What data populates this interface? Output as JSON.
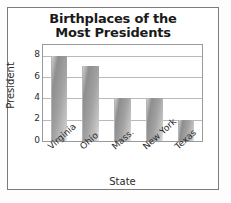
{
  "chart_data": {
    "type": "bar",
    "title": "Birthplaces of the Most Presidents",
    "title_lines": [
      "Birthplaces of the",
      "Most Presidents"
    ],
    "categories": [
      "Virginia",
      "Ohio",
      "Mass.",
      "New York",
      "Texas"
    ],
    "values": [
      8,
      7,
      4,
      4,
      2
    ],
    "xlabel": "State",
    "ylabel": "President",
    "yticks": [
      8,
      6,
      4,
      2,
      0
    ],
    "ylim": [
      0,
      9
    ],
    "grid": "horizontal",
    "legend": "none",
    "bar_color": "#a0a0a0",
    "gridline_color": "#b9b9b9",
    "frame_color": "#7b7b7b",
    "text_color": "#1a1a1a"
  }
}
